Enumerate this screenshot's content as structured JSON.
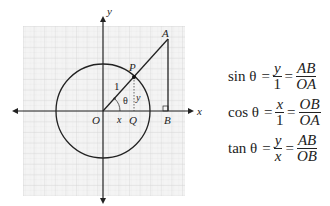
{
  "diagram": {
    "axes": {
      "x_label": "x",
      "y_label": "y"
    },
    "points": {
      "O": "O",
      "P": "P",
      "Q": "Q",
      "A": "A",
      "B": "B"
    },
    "segment_labels": {
      "radius": "1",
      "angle": "θ",
      "adjacent": "x",
      "opposite": "y"
    },
    "colors": {
      "grid": "#d8d8d8",
      "grid_bg": "#f4f4f4",
      "lines": "#222222"
    }
  },
  "formulas": [
    {
      "fn": "sin θ",
      "num1": "y",
      "den1": "1",
      "num2": "AB",
      "den2": "OA"
    },
    {
      "fn": "cos θ",
      "num1": "x",
      "den1": "1",
      "num2": "OB",
      "den2": "OA"
    },
    {
      "fn": "tan θ",
      "num1": "y",
      "den1": "x",
      "num2": "AB",
      "den2": "OB"
    }
  ]
}
